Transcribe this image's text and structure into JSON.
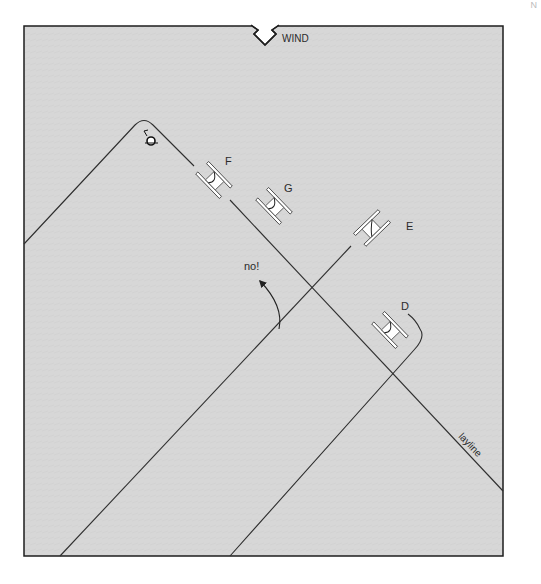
{
  "page": {
    "corner_mark": "N"
  },
  "diagram": {
    "wind_label": "WIND",
    "layline_label": "layline",
    "annotation_no": "no!",
    "boats": [
      {
        "id": "F",
        "label": "F"
      },
      {
        "id": "G",
        "label": "G"
      },
      {
        "id": "E",
        "label": "E"
      },
      {
        "id": "D",
        "label": "D"
      }
    ],
    "colors": {
      "water": "#d6d6d6",
      "line": "#2e2e2e",
      "boat_fill": "#ffffff",
      "border": "#1e1e1e"
    }
  }
}
